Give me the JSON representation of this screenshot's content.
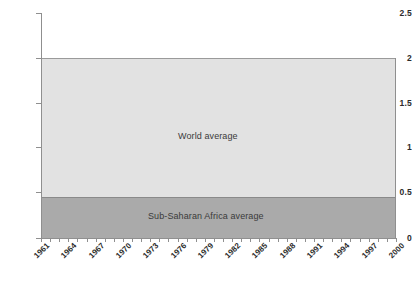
{
  "chart_data": {
    "type": "area",
    "title": "",
    "subtitle": "",
    "xlabel": "",
    "ylabel": "",
    "xlim": [
      1961,
      2000
    ],
    "ylim": [
      0,
      2.5
    ],
    "yticks": [
      0,
      0.5,
      1,
      1.5,
      2,
      2.5
    ],
    "ytick_labels": [
      "0",
      "0.5",
      "1",
      "1.5",
      "2",
      "2.5"
    ],
    "xticks": [
      1961,
      1964,
      1967,
      1970,
      1973,
      1976,
      1979,
      1982,
      1985,
      1988,
      1991,
      1994,
      1997,
      2000
    ],
    "xtick_labels": [
      "1961",
      "1964",
      "1967",
      "1970",
      "1973",
      "1976",
      "1979",
      "1982",
      "1985",
      "1988",
      "1991",
      "1994",
      "1997",
      "2000"
    ],
    "grid": false,
    "legend_position": "inline-annotation",
    "stacked": true,
    "series": [
      {
        "name": "Sub-Saharan Africa average",
        "color": "#aaaaaa",
        "annotation": "Sub-Saharan Africa average",
        "x": [
          1961,
          1964,
          1967,
          1970,
          1973,
          1976,
          1979,
          1982,
          1985,
          1988,
          1991,
          1994,
          1997,
          2000
        ],
        "values": [
          0.46,
          0.46,
          0.46,
          0.46,
          0.46,
          0.46,
          0.46,
          0.46,
          0.46,
          0.46,
          0.46,
          0.46,
          0.46,
          0.46
        ]
      },
      {
        "name": "World average",
        "color": "#e2e2e2",
        "annotation": "World average",
        "x": [
          1961,
          1964,
          1967,
          1970,
          1973,
          1976,
          1979,
          1982,
          1985,
          1988,
          1991,
          1994,
          1997,
          2000
        ],
        "values": [
          2.0,
          2.0,
          2.0,
          2.0,
          2.0,
          2.0,
          2.0,
          2.0,
          2.0,
          2.0,
          2.0,
          2.0,
          2.0,
          2.0
        ]
      }
    ],
    "annotations": [
      {
        "text": "World average",
        "value": 2.0
      },
      {
        "text": "Sub-Saharan Africa average",
        "value": 0.46
      }
    ]
  },
  "axis": {
    "y": {
      "t0": "0",
      "t1": "0.5",
      "t2": "1",
      "t3": "1.5",
      "t4": "2",
      "t5": "2.5"
    },
    "x": {
      "t0": "1961",
      "t1": "1964",
      "t2": "1967",
      "t3": "1970",
      "t4": "1973",
      "t5": "1976",
      "t6": "1979",
      "t7": "1982",
      "t8": "1985",
      "t9": "1988",
      "t10": "1991",
      "t11": "1994",
      "t12": "1997",
      "t13": "2000"
    }
  },
  "labels": {
    "world": "World average",
    "ssa": "Sub-Saharan Africa average"
  },
  "colors": {
    "world_band": "#e2e2e2",
    "ssa_band": "#aaaaaa",
    "axis": "#8f8f8f",
    "text": "#2b2b2b",
    "background": "#ffffff"
  }
}
